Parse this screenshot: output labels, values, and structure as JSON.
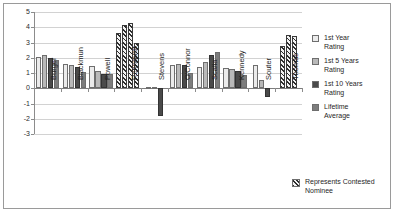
{
  "chart_data": {
    "type": "bar",
    "title": "",
    "subtitle": "",
    "xlabel": "",
    "ylabel": "",
    "ylim": [
      -3,
      5
    ],
    "yticks": [
      5,
      4,
      3,
      2,
      1,
      0,
      -1,
      -2,
      -3
    ],
    "ytick_labels": [
      "5",
      "4",
      "3",
      "2",
      "1",
      "0",
      "-1",
      "-2",
      "-3"
    ],
    "grid": true,
    "legend_position": "right",
    "categories": [
      "Burger",
      "Blackmun",
      "Powell",
      "Rehnquist",
      "Stevens",
      "O'Connor",
      "Scalia",
      "Kennedy",
      "Souter",
      "Thomas"
    ],
    "series": [
      {
        "name": "1st Year Rating",
        "color": "#ebebeb",
        "values": [
          2.05,
          1.6,
          1.45,
          3.6,
          0.1,
          1.55,
          1.4,
          1.35,
          1.55,
          2.8
        ]
      },
      {
        "name": "1st 5 Years Rating",
        "color": "#b9b9b9",
        "values": [
          2.2,
          1.5,
          1.15,
          4.15,
          0.05,
          1.6,
          1.7,
          1.25,
          0.55,
          3.5
        ]
      },
      {
        "name": "1st 10 Years Rating",
        "color": "#4a4a4a",
        "values": [
          2.0,
          1.4,
          0.95,
          4.3,
          -1.85,
          1.55,
          2.2,
          1.1,
          -0.55,
          3.45
        ]
      },
      {
        "name": "Lifetime Average",
        "color": "#7d7d7d",
        "values": [
          1.85,
          1.05,
          0.95,
          2.95,
          null,
          1.0,
          2.35,
          0.85,
          null,
          null
        ]
      }
    ],
    "contested_nominees": [
      "Rehnquist",
      "Thomas"
    ],
    "contested_note": "Represents Contested Nominee"
  },
  "legend": {
    "items": [
      {
        "label_line1": "1st Year",
        "label_line2": "Rating"
      },
      {
        "label_line1": "1st 5 Years",
        "label_line2": "Rating"
      },
      {
        "label_line1": "1st 10 Years",
        "label_line2": "Rating"
      },
      {
        "label_line1": "Lifetime",
        "label_line2": "Average"
      }
    ]
  },
  "note": {
    "line1": "Represents Contested",
    "line2": "Nominee"
  }
}
